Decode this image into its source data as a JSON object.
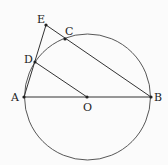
{
  "diagram": {
    "type": "geometry",
    "points": {
      "A": {
        "label": "A",
        "x": 24,
        "y": 97
      },
      "B": {
        "label": "B",
        "x": 151,
        "y": 97
      },
      "O": {
        "label": "O",
        "x": 87,
        "y": 97
      },
      "C": {
        "label": "C",
        "x": 65,
        "y": 39
      },
      "D": {
        "label": "D",
        "x": 35,
        "y": 62
      },
      "E": {
        "label": "E",
        "x": 46,
        "y": 25
      }
    },
    "circle": {
      "center": "O",
      "radius": 63
    },
    "segments": [
      "AB",
      "AE",
      "EB",
      "DO"
    ],
    "colors": {
      "stroke": "#333333",
      "background": "#fbfbfb"
    }
  }
}
